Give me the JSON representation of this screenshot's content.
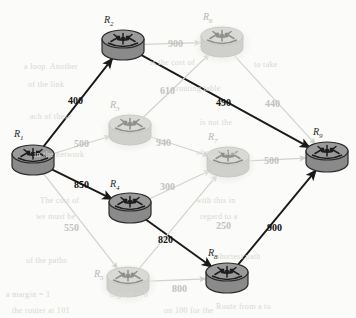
{
  "figure": {
    "kind": "network-routing-diagram",
    "background_color": "#fbfbf9",
    "colors": {
      "active_edge": "#1a1a1a",
      "inactive_edge": "#d2d2ce",
      "active_node_body": "#8a8a8a",
      "active_node_top": "#9a9a9a",
      "active_node_outline": "#2b2b2b",
      "inactive_node_body": "#cfcfcb",
      "inactive_node_top": "#d9d9d5",
      "inactive_node_outline": "#c3c3bf",
      "label_active": "#111111",
      "label_inactive": "#c2c2be"
    }
  },
  "nodes": [
    {
      "id": "R1",
      "label": "R",
      "sub": "1",
      "x": 33,
      "y": 160,
      "state": "active",
      "label_x": 14,
      "label_y": 128
    },
    {
      "id": "R2",
      "label": "R",
      "sub": "2",
      "x": 123,
      "y": 45,
      "state": "active",
      "label_x": 104,
      "label_y": 14
    },
    {
      "id": "R3",
      "label": "R",
      "sub": "3",
      "x": 130,
      "y": 130,
      "state": "inactive",
      "label_x": 110,
      "label_y": 99
    },
    {
      "id": "R4",
      "label": "R",
      "sub": "4",
      "x": 130,
      "y": 208,
      "state": "active",
      "label_x": 110,
      "label_y": 178
    },
    {
      "id": "R5",
      "label": "R",
      "sub": "5",
      "x": 128,
      "y": 282,
      "state": "inactive",
      "label_x": 94,
      "label_y": 268
    },
    {
      "id": "R6",
      "label": "R",
      "sub": "6",
      "x": 222,
      "y": 42,
      "state": "inactive",
      "label_x": 203,
      "label_y": 11
    },
    {
      "id": "R7",
      "label": "R",
      "sub": "7",
      "x": 228,
      "y": 162,
      "state": "inactive",
      "label_x": 208,
      "label_y": 131
    },
    {
      "id": "R8",
      "label": "R",
      "sub": "8",
      "x": 227,
      "y": 278,
      "state": "active",
      "label_x": 208,
      "label_y": 247
    },
    {
      "id": "R9",
      "label": "R",
      "sub": "9",
      "x": 327,
      "y": 157,
      "state": "active",
      "label_x": 313,
      "label_y": 126
    }
  ],
  "edges": [
    {
      "from": "R1",
      "to": "R2",
      "weight": "400",
      "state": "active",
      "label_x": 68,
      "label_y": 95
    },
    {
      "from": "R1",
      "to": "R3",
      "weight": "500",
      "state": "inactive",
      "label_x": 74,
      "label_y": 138
    },
    {
      "from": "R1",
      "to": "R4",
      "weight": "850",
      "state": "active",
      "label_x": 74,
      "label_y": 179
    },
    {
      "from": "R1",
      "to": "R5",
      "weight": "550",
      "state": "inactive",
      "label_x": 64,
      "label_y": 222
    },
    {
      "from": "R2",
      "to": "R6",
      "weight": "900",
      "state": "inactive",
      "label_x": 168,
      "label_y": 38
    },
    {
      "from": "R2",
      "to": "R9",
      "weight": "490",
      "state": "active",
      "label_x": 216,
      "label_y": 97
    },
    {
      "from": "R3",
      "to": "R6",
      "weight": "610",
      "state": "inactive",
      "label_x": 160,
      "label_y": 85
    },
    {
      "from": "R3",
      "to": "R7",
      "weight": "940",
      "state": "inactive",
      "label_x": 156,
      "label_y": 137
    },
    {
      "from": "R4",
      "to": "R7",
      "weight": "300",
      "state": "inactive",
      "label_x": 160,
      "label_y": 181
    },
    {
      "from": "R4",
      "to": "R8",
      "weight": "820",
      "state": "active",
      "label_x": 158,
      "label_y": 234
    },
    {
      "from": "R5",
      "to": "R8",
      "weight": "800",
      "state": "inactive",
      "label_x": 172,
      "label_y": 283
    },
    {
      "from": "R6",
      "to": "R9",
      "weight": "440",
      "state": "inactive",
      "label_x": 265,
      "label_y": 98
    },
    {
      "from": "R7",
      "to": "R9",
      "weight": "500",
      "state": "inactive",
      "label_x": 264,
      "label_y": 155
    },
    {
      "from": "R8",
      "to": "R9",
      "weight": "900",
      "state": "active",
      "label_x": 267,
      "label_y": 222
    },
    {
      "from": "R5",
      "to": "R7",
      "weight": "250",
      "state": "inactive",
      "label_x": 216,
      "label_y": 220
    }
  ],
  "background_text": [
    {
      "text": "a loop. Another",
      "x": 24,
      "y": 62
    },
    {
      "text": "is the  cost  of",
      "x": 150,
      "y": 58
    },
    {
      "text": "to  take",
      "x": 254,
      "y": 60
    },
    {
      "text": "of   the   link",
      "x": 28,
      "y": 80
    },
    {
      "text": "routing  table",
      "x": 176,
      "y": 84
    },
    {
      "text": "ach  of  these",
      "x": 30,
      "y": 112
    },
    {
      "text": "is  not   the",
      "x": 200,
      "y": 118
    },
    {
      "text": "in  the  network",
      "x": 34,
      "y": 150
    },
    {
      "text": "of  each  link",
      "x": 196,
      "y": 148
    },
    {
      "text": "The  cost  of",
      "x": 40,
      "y": 196
    },
    {
      "text": "with  this  in",
      "x": 196,
      "y": 196
    },
    {
      "text": "we  must  be",
      "x": 36,
      "y": 212
    },
    {
      "text": "regard  to  a",
      "x": 200,
      "y": 212
    },
    {
      "text": "of  the  paths",
      "x": 26,
      "y": 256
    },
    {
      "text": "shortest  path",
      "x": 216,
      "y": 252
    },
    {
      "text": "a  margin  =  1",
      "x": 6,
      "y": 290
    },
    {
      "text": "digram  =  0",
      "x": 110,
      "y": 290
    },
    {
      "text": "the  router  at  101",
      "x": 12,
      "y": 306
    },
    {
      "text": "on  100  for  the",
      "x": 164,
      "y": 306
    },
    {
      "text": "Route  from  a  to",
      "x": 216,
      "y": 302
    }
  ]
}
